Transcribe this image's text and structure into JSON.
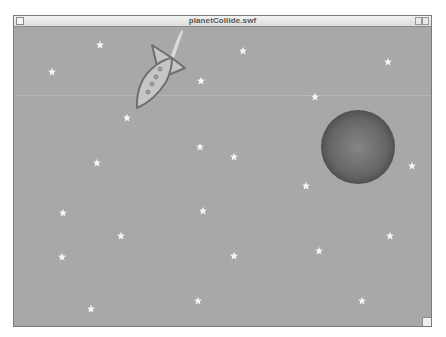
{
  "window": {
    "title": "planetCollide.swf",
    "controls": [
      "close-box",
      "zoom-box",
      "collapse-box",
      "resize-box"
    ]
  },
  "scene": {
    "background_color": "#a8a8a8",
    "star_color": "#f4f4f4",
    "rocket": {
      "body_color": "#c4c4c4",
      "outline_color": "#6e6e6e",
      "porthole_color": "#9a9a9a",
      "portholes": 4,
      "flame_color": "#d8d8d8"
    },
    "planet": {
      "cx": 358,
      "cy": 147,
      "r": 37,
      "center_color": "#808080",
      "edge_color": "#4a4a4a"
    },
    "stars": [
      {
        "x": 100,
        "y": 45
      },
      {
        "x": 52,
        "y": 72
      },
      {
        "x": 243,
        "y": 51
      },
      {
        "x": 201,
        "y": 81
      },
      {
        "x": 388,
        "y": 62
      },
      {
        "x": 315,
        "y": 97
      },
      {
        "x": 127,
        "y": 118
      },
      {
        "x": 200,
        "y": 147
      },
      {
        "x": 234,
        "y": 157
      },
      {
        "x": 97,
        "y": 163
      },
      {
        "x": 306,
        "y": 186
      },
      {
        "x": 412,
        "y": 166
      },
      {
        "x": 63,
        "y": 213
      },
      {
        "x": 203,
        "y": 211
      },
      {
        "x": 121,
        "y": 236
      },
      {
        "x": 390,
        "y": 236
      },
      {
        "x": 319,
        "y": 251
      },
      {
        "x": 234,
        "y": 256
      },
      {
        "x": 62,
        "y": 257
      },
      {
        "x": 198,
        "y": 301
      },
      {
        "x": 362,
        "y": 301
      },
      {
        "x": 91,
        "y": 309
      }
    ]
  }
}
